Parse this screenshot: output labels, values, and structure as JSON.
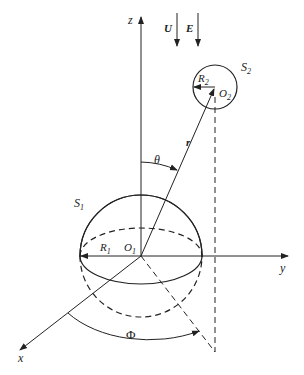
{
  "diagram": {
    "axes": {
      "z_label": "z",
      "y_label": "y",
      "x_label": "x"
    },
    "field_arrows": {
      "U_label": "U",
      "E_label": "E"
    },
    "sphere1": {
      "name_main": "S",
      "name_sub": "1",
      "radius_main": "R",
      "radius_sub": "1",
      "center_main": "O",
      "center_sub": "1"
    },
    "sphere2": {
      "name_main": "S",
      "name_sub": "2",
      "radius_main": "R",
      "radius_sub": "2",
      "center_main": "O",
      "center_sub": "2"
    },
    "vector_label": "r",
    "theta_label": "θ",
    "phi_label": "Φ",
    "colors": {
      "stroke": "#222222",
      "background": "#ffffff"
    }
  }
}
